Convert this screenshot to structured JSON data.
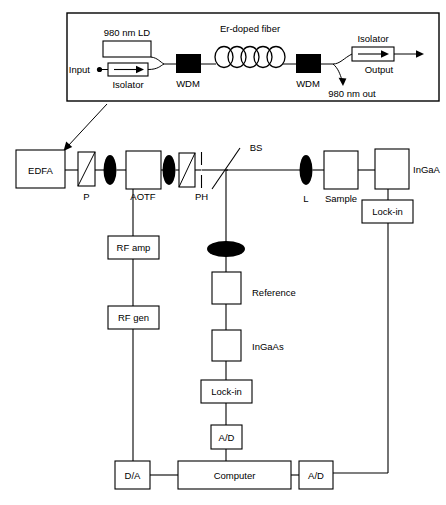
{
  "figure": {
    "background": "#ffffff",
    "line_color": "#000000"
  },
  "inset": {
    "name": "EDFA internal detail",
    "labels": {
      "pump": "980 nm LD",
      "fiber": "Er-doped fiber",
      "isolator_in": "Isolator",
      "isolator_out": "Isolator",
      "input": "Input",
      "output": "Output",
      "wdm_left": "WDM",
      "wdm_right": "WDM",
      "pump_out": "980 nm out"
    },
    "coil_turns": 5
  },
  "beam_path": {
    "components": [
      {
        "id": "edfa",
        "label": "EDFA",
        "type": "box"
      },
      {
        "id": "pol1",
        "label": "P",
        "type": "polarizer"
      },
      {
        "id": "lens1",
        "label": "",
        "type": "lens"
      },
      {
        "id": "aotf",
        "label": "AOTF",
        "type": "box"
      },
      {
        "id": "lens2",
        "label": "",
        "type": "lens"
      },
      {
        "id": "pol2",
        "label": "",
        "type": "polarizer"
      },
      {
        "id": "ph",
        "label": "PH",
        "type": "pinhole"
      },
      {
        "id": "bs",
        "label": "BS",
        "type": "beamsplitter"
      },
      {
        "id": "lens3",
        "label": "L",
        "type": "lens"
      },
      {
        "id": "sample",
        "label": "Sample",
        "type": "box"
      },
      {
        "id": "det1",
        "label": "InGaA",
        "type": "box"
      }
    ]
  },
  "rf_branch": {
    "items": [
      {
        "id": "rf_amp",
        "label": "RF amp"
      },
      {
        "id": "rf_gen",
        "label": "RF gen"
      }
    ]
  },
  "reference_branch": {
    "items": [
      {
        "id": "ref_lens",
        "label": "",
        "type": "lens"
      },
      {
        "id": "reference",
        "label": "Reference"
      },
      {
        "id": "ref_det",
        "label": "InGaAs"
      },
      {
        "id": "ref_lockin",
        "label": "Lock-in"
      },
      {
        "id": "ref_ad",
        "label": "A/D"
      }
    ]
  },
  "sample_branch": {
    "items": [
      {
        "id": "sample_lockin",
        "label": "Lock-in"
      }
    ]
  },
  "bottom_row": {
    "items": [
      {
        "id": "da",
        "label": "D/A"
      },
      {
        "id": "computer",
        "label": "Computer"
      },
      {
        "id": "ad",
        "label": "A/D"
      }
    ]
  }
}
